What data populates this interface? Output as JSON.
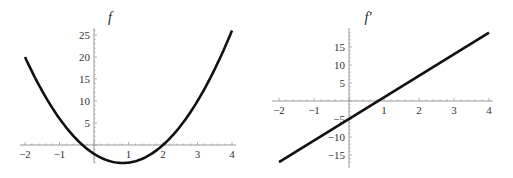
{
  "chart_data": [
    {
      "type": "line",
      "title": "f",
      "function": "3x^2 - 5x - 2",
      "x": [
        -2,
        -1.5,
        -1,
        -0.5,
        0,
        0.5,
        0.8333,
        1,
        1.5,
        2,
        2.5,
        3,
        3.5,
        4
      ],
      "values": [
        20,
        12.25,
        6,
        1.25,
        -2,
        -3.75,
        -4.08,
        -4,
        -2.75,
        0,
        4.25,
        10,
        16.25,
        26
      ],
      "xlim": [
        -2,
        4
      ],
      "ylim": [
        -4.1,
        26
      ],
      "xticks": [
        "-2",
        "-1",
        "1",
        "2",
        "3",
        "4"
      ],
      "yticks": [
        "5",
        "10",
        "15",
        "20",
        "25"
      ],
      "xlabel": "",
      "ylabel": "",
      "grid": false
    },
    {
      "type": "line",
      "title": "f′",
      "function": "6x - 5",
      "x": [
        -2,
        4
      ],
      "values": [
        -17,
        19
      ],
      "xlim": [
        -2,
        4
      ],
      "ylim": [
        -17,
        19
      ],
      "xticks": [
        "-2",
        "-1",
        "1",
        "2",
        "3",
        "4"
      ],
      "yticks": [
        "-15",
        "-10",
        "-5",
        "5",
        "10",
        "15"
      ],
      "xlabel": "",
      "ylabel": "",
      "grid": false
    }
  ],
  "plots": {
    "left": {
      "title": "f"
    },
    "right": {
      "title": "f′"
    }
  },
  "colors": {
    "curve": "#111111",
    "axis": "#999999",
    "text": "#333333"
  }
}
